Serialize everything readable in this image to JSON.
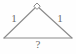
{
  "figure": {
    "kind": "geometry-diagram",
    "shape_name": "isosceles-triangle",
    "background_color": "#fefefe",
    "stroke_color": "#8a8a8a",
    "label_color": "#6b6b6b",
    "apex_marker": {
      "icon": "diamond-vertex-marker",
      "fill": "#ffffff",
      "stroke": "#8a8a8a"
    },
    "labels": {
      "left_side": "1",
      "right_side": "1",
      "base": "?"
    },
    "vertices": {
      "apex": [
        37,
        6
      ],
      "bottom_left": [
        4,
        38
      ],
      "bottom_right": [
        72,
        38
      ]
    }
  }
}
